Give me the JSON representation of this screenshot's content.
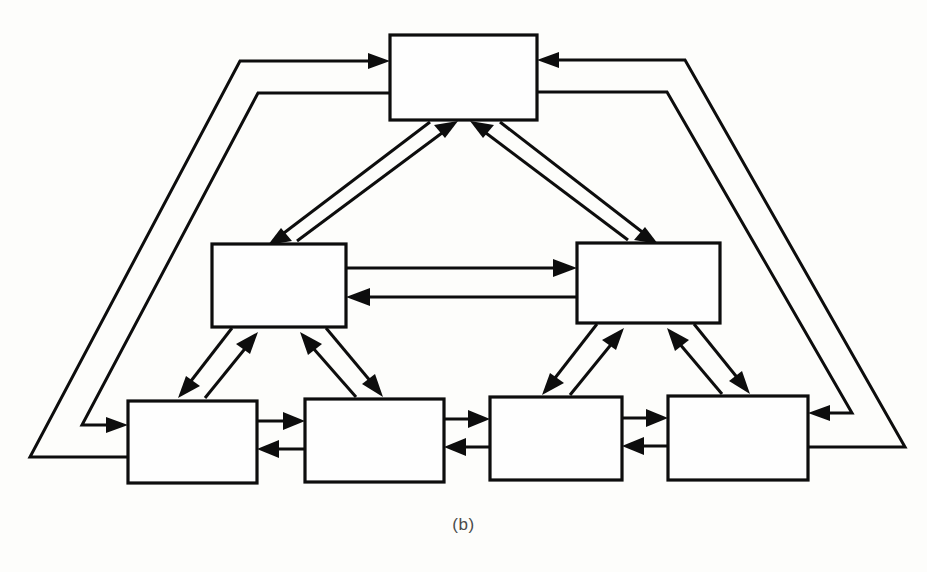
{
  "figure": {
    "caption": "(b)",
    "background_color": "#fdfdfb",
    "line_color": "#0d0d0d",
    "box_fill": "#fefefe",
    "width": 927,
    "height": 572
  },
  "nodes": [
    {
      "id": "top",
      "label": "",
      "x": 390,
      "y": 35,
      "w": 147,
      "h": 85,
      "level": "root"
    },
    {
      "id": "mid-l",
      "label": "",
      "x": 212,
      "y": 244,
      "w": 134,
      "h": 83,
      "level": "middle"
    },
    {
      "id": "mid-r",
      "label": "",
      "x": 577,
      "y": 243,
      "w": 143,
      "h": 80,
      "level": "middle"
    },
    {
      "id": "leaf-1",
      "label": "",
      "x": 128,
      "y": 401,
      "w": 129,
      "h": 82,
      "level": "leaf"
    },
    {
      "id": "leaf-2",
      "label": "",
      "x": 305,
      "y": 399,
      "w": 139,
      "h": 83,
      "level": "leaf"
    },
    {
      "id": "leaf-3",
      "label": "",
      "x": 490,
      "y": 397,
      "w": 132,
      "h": 83,
      "level": "leaf"
    },
    {
      "id": "leaf-4",
      "label": "",
      "x": 668,
      "y": 396,
      "w": 140,
      "h": 84,
      "level": "leaf"
    }
  ],
  "edges": [
    {
      "id": "e-top-midl-down",
      "from": "top",
      "to": "mid-l",
      "kind": "diagonal",
      "arrow": "to"
    },
    {
      "id": "e-midl-top-up",
      "from": "mid-l",
      "to": "top",
      "kind": "diagonal",
      "arrow": "to"
    },
    {
      "id": "e-top-midr-down",
      "from": "top",
      "to": "mid-r",
      "kind": "diagonal",
      "arrow": "to"
    },
    {
      "id": "e-midr-top-up",
      "from": "mid-r",
      "to": "top",
      "kind": "diagonal",
      "arrow": "to"
    },
    {
      "id": "e-midl-midr",
      "from": "mid-l",
      "to": "mid-r",
      "kind": "horizontal",
      "arrow": "to"
    },
    {
      "id": "e-midr-midl",
      "from": "mid-r",
      "to": "mid-l",
      "kind": "horizontal",
      "arrow": "to"
    },
    {
      "id": "e-midl-leaf1",
      "from": "mid-l",
      "to": "leaf-1",
      "kind": "diagonal",
      "arrow": "to"
    },
    {
      "id": "e-leaf1-midl",
      "from": "leaf-1",
      "to": "mid-l",
      "kind": "diagonal",
      "arrow": "to"
    },
    {
      "id": "e-midl-leaf2",
      "from": "mid-l",
      "to": "leaf-2",
      "kind": "diagonal",
      "arrow": "to"
    },
    {
      "id": "e-leaf2-midl",
      "from": "leaf-2",
      "to": "mid-l",
      "kind": "diagonal",
      "arrow": "to"
    },
    {
      "id": "e-midr-leaf3",
      "from": "mid-r",
      "to": "leaf-3",
      "kind": "diagonal",
      "arrow": "to"
    },
    {
      "id": "e-leaf3-midr",
      "from": "leaf-3",
      "to": "mid-r",
      "kind": "diagonal",
      "arrow": "to"
    },
    {
      "id": "e-midr-leaf4",
      "from": "mid-r",
      "to": "leaf-4",
      "kind": "diagonal",
      "arrow": "to"
    },
    {
      "id": "e-leaf4-midr",
      "from": "leaf-4",
      "to": "mid-r",
      "kind": "diagonal",
      "arrow": "to"
    },
    {
      "id": "e-leaf1-leaf2",
      "from": "leaf-1",
      "to": "leaf-2",
      "kind": "horizontal",
      "arrow": "to"
    },
    {
      "id": "e-leaf2-leaf1",
      "from": "leaf-2",
      "to": "leaf-1",
      "kind": "horizontal",
      "arrow": "to"
    },
    {
      "id": "e-leaf2-leaf3",
      "from": "leaf-2",
      "to": "leaf-3",
      "kind": "horizontal",
      "arrow": "to"
    },
    {
      "id": "e-leaf3-leaf2",
      "from": "leaf-3",
      "to": "leaf-2",
      "kind": "horizontal",
      "arrow": "to"
    },
    {
      "id": "e-leaf3-leaf4",
      "from": "leaf-3",
      "to": "leaf-4",
      "kind": "horizontal",
      "arrow": "to"
    },
    {
      "id": "e-leaf4-leaf3",
      "from": "leaf-4",
      "to": "leaf-3",
      "kind": "horizontal",
      "arrow": "to"
    },
    {
      "id": "e-leaf1-top-wrap",
      "from": "leaf-1",
      "to": "top",
      "kind": "wraparound-left",
      "arrow": "to"
    },
    {
      "id": "e-top-leaf1-wrap",
      "from": "top",
      "to": "leaf-1",
      "kind": "wraparound-left",
      "arrow": "to"
    },
    {
      "id": "e-leaf4-top-wrap",
      "from": "leaf-4",
      "to": "top",
      "kind": "wraparound-right",
      "arrow": "to"
    },
    {
      "id": "e-top-leaf4-wrap",
      "from": "top",
      "to": "leaf-4",
      "kind": "wraparound-right",
      "arrow": "to"
    }
  ]
}
